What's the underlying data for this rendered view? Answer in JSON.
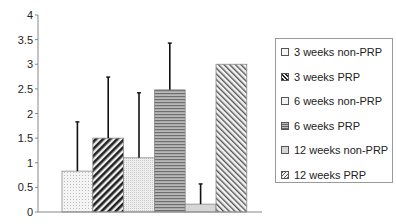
{
  "chart_data": {
    "type": "bar",
    "title": "",
    "xlabel": "",
    "ylabel": "",
    "ylim": [
      0,
      4
    ],
    "yticks": [
      "0",
      "0.5",
      "1",
      "1.5",
      "2",
      "2.5",
      "3",
      "3.5",
      "4"
    ],
    "grid": false,
    "legend_position": "right",
    "categories": [
      "3 weeks non-PRP",
      "3 weeks PRP",
      "6 weeks non-PRP",
      "6 weeks PRP",
      "12 weeks non-PRP",
      "12 weeks PRP"
    ],
    "values": [
      0.83,
      1.5,
      1.1,
      2.48,
      0.16,
      3.0
    ],
    "error_upper": [
      1.83,
      2.74,
      2.42,
      3.43,
      0.57,
      null
    ],
    "patterns": [
      "fine-dots",
      "dark-diagonal-hatch",
      "dense-dots",
      "horizontal-lines",
      "light-gray",
      "diagonal-hatch"
    ]
  },
  "legend": {
    "items": [
      {
        "label": "3 weeks non-PRP"
      },
      {
        "label": "3 weeks PRP"
      },
      {
        "label": "6 weeks non-PRP"
      },
      {
        "label": "6 weeks PRP"
      },
      {
        "label": "12 weeks non-PRP"
      },
      {
        "label": "12 weeks PRP"
      }
    ]
  }
}
